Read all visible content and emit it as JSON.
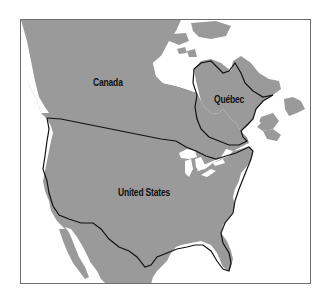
{
  "map": {
    "labels": {
      "canada": "Canada",
      "quebec": "Québec",
      "united_states": "United States"
    },
    "colors": {
      "land": "#9a9a9a",
      "water": "#ffffff",
      "border": "#111111",
      "frame": "#6e6e6e"
    }
  }
}
